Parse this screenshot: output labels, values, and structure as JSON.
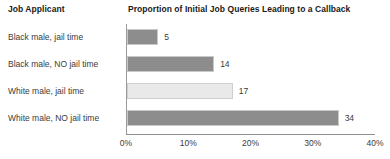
{
  "headers": {
    "left": "Job Applicant",
    "right": "Proportion of Initial Job Queries Leading to a Callback"
  },
  "chart_data": {
    "type": "bar",
    "orientation": "horizontal",
    "title": "Proportion of Initial Job Queries Leading to a Callback",
    "xlabel": "",
    "ylabel": "Job Applicant",
    "categories": [
      "Black male, jail time",
      "Black male, NO jail time",
      "White male, jail time",
      "White male, NO jail time"
    ],
    "values": [
      5,
      14,
      17,
      34
    ],
    "value_labels": [
      "5",
      "14",
      "17",
      "34"
    ],
    "xlim": [
      0,
      40
    ],
    "xticks": [
      0,
      10,
      20,
      30,
      40
    ],
    "xtick_labels": [
      "0%",
      "10%",
      "20%",
      "30%",
      "40%"
    ],
    "grid": false,
    "legend": false,
    "bar_colors": [
      "#8d8d8d",
      "#8d8d8d",
      "#e9e9e9",
      "#8d8d8d"
    ],
    "bar_styles": [
      "dark",
      "dark",
      "light",
      "dark"
    ],
    "axis_color": "#8f8f8f",
    "text_color": "#3b3b3b"
  }
}
